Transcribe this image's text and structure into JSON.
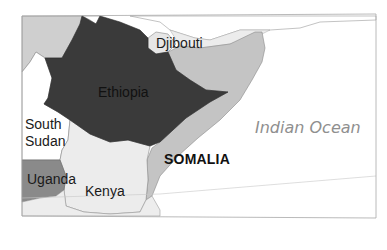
{
  "map": {
    "region": "Horn of Africa",
    "highlighted_country": "Ethiopia",
    "colors": {
      "highlight": "#3a3a3a",
      "somalia": "#c4c4c4",
      "neighbors_light": "#e9e9e9",
      "neighbors_mid": "#cfcfcf",
      "uganda": "#8a8a8a",
      "ocean": "#ffffff",
      "frame": "#9a9a9a"
    },
    "labels": {
      "ethiopia": "Ethiopia",
      "djibouti": "Djibouti",
      "somalia": "SOMALIA",
      "south_sudan_line1": "South",
      "south_sudan_line2": "Sudan",
      "uganda": "Uganda",
      "kenya": "Kenya",
      "indian_ocean": "Indian Ocean"
    }
  }
}
